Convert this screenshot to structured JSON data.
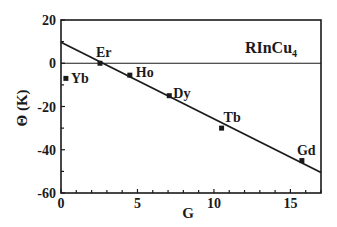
{
  "chart_data": {
    "type": "scatter",
    "title": "RInCu4",
    "title_main": "RInCu",
    "title_subscript": "4",
    "xlabel": "G",
    "ylabel": "Θ (K)",
    "xlim": [
      0,
      17
    ],
    "ylim": [
      -60,
      20
    ],
    "x_ticks": [
      0,
      5,
      10,
      15
    ],
    "y_ticks": [
      20,
      0,
      -20,
      -40,
      -60
    ],
    "grid": false,
    "legend": null,
    "reference_line": {
      "y": 0
    },
    "points": [
      {
        "label": "Yb",
        "x": 0.32,
        "y": -7
      },
      {
        "label": "Er",
        "x": 2.55,
        "y": 0
      },
      {
        "label": "Ho",
        "x": 4.5,
        "y": -5.5
      },
      {
        "label": "Dy",
        "x": 7.08,
        "y": -15
      },
      {
        "label": "Tb",
        "x": 10.5,
        "y": -30
      },
      {
        "label": "Gd",
        "x": 15.75,
        "y": -45
      }
    ],
    "fit_line": {
      "x": [
        0,
        17
      ],
      "y": [
        9.7,
        -50.5
      ]
    }
  },
  "colors": {
    "ink": "#1a1a1a",
    "background": "#ffffff"
  }
}
